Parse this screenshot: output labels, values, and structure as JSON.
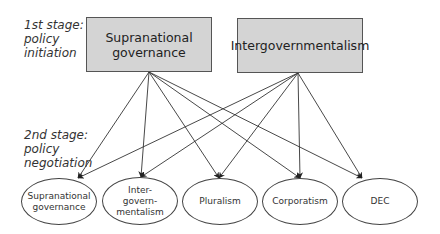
{
  "stages": {
    "first": "1st stage:\npolicy\ninitiation",
    "second": "2nd stage:\npolicy\nnegotiation"
  },
  "sources": [
    {
      "id": "supra",
      "label": "Supranational\ngovernance"
    },
    {
      "id": "inter",
      "label": "Intergovernmentalism"
    }
  ],
  "targets": [
    {
      "id": "t_supra",
      "label": "Supranational\ngovernance"
    },
    {
      "id": "t_inter",
      "label": "Inter-\ngovern-\nmentalism"
    },
    {
      "id": "t_plural",
      "label": "Pluralism"
    },
    {
      "id": "t_corp",
      "label": "Corporatism"
    },
    {
      "id": "t_dec",
      "label": "DEC"
    }
  ],
  "edges": [
    [
      "supra",
      "t_supra"
    ],
    [
      "supra",
      "t_inter"
    ],
    [
      "supra",
      "t_plural"
    ],
    [
      "supra",
      "t_corp"
    ],
    [
      "supra",
      "t_dec"
    ],
    [
      "inter",
      "t_supra"
    ],
    [
      "inter",
      "t_inter"
    ],
    [
      "inter",
      "t_plural"
    ],
    [
      "inter",
      "t_corp"
    ],
    [
      "inter",
      "t_dec"
    ]
  ],
  "colors": {
    "box_fill": "#d4d4d4",
    "stroke": "#333333"
  }
}
